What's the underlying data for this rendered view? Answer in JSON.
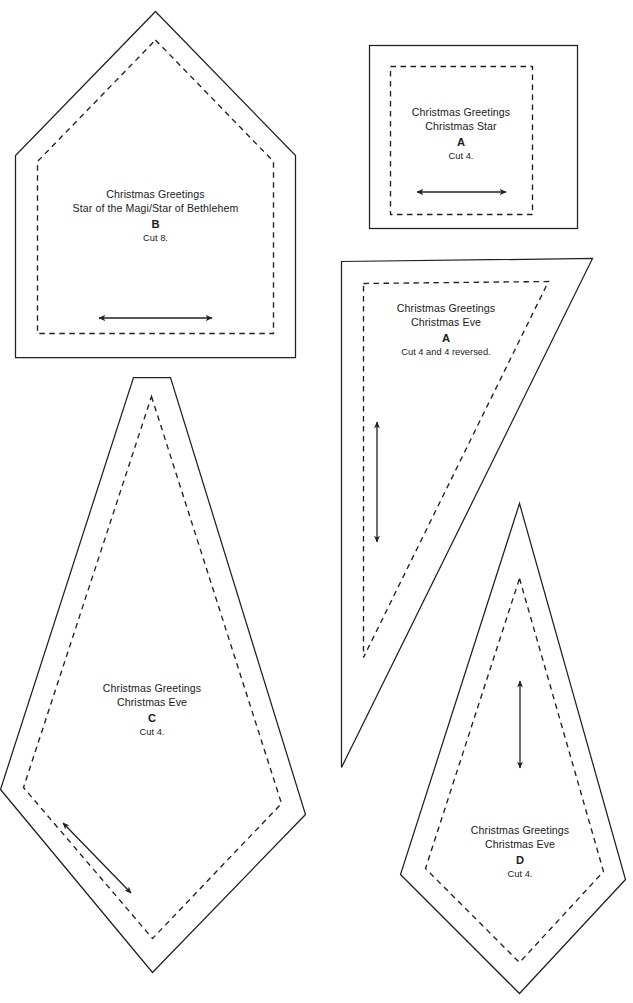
{
  "document": {
    "kind": "quilt-template-sheet",
    "page_background": "#ffffff",
    "ink_color": "#221f1f"
  },
  "footer": {
    "text": ""
  },
  "templates": [
    {
      "id": "B",
      "shape": "pentagon-house",
      "line1": "Christmas Greetings",
      "line2": "Star of the Magi/Star of Bethlehem",
      "letter": "B",
      "cut": "Cut 8.",
      "grain": {
        "direction": "horizontal",
        "arrowheads": "both"
      }
    },
    {
      "id": "A-star",
      "shape": "square",
      "line1": "Christmas Greetings",
      "line2": "Christmas Star",
      "letter": "A",
      "cut": "Cut 4.",
      "grain": {
        "direction": "horizontal",
        "arrowheads": "both"
      }
    },
    {
      "id": "A-eve",
      "shape": "right-triangle",
      "line1": "Christmas Greetings",
      "line2": "Christmas Eve",
      "letter": "A",
      "cut": "Cut 4 and 4 reversed.",
      "grain": {
        "direction": "vertical",
        "arrowheads": "both"
      }
    },
    {
      "id": "C",
      "shape": "kite-truncated-top",
      "line1": "Christmas Greetings",
      "line2": "Christmas Eve",
      "letter": "C",
      "cut": "Cut 4.",
      "grain": {
        "direction": "diagonal",
        "arrowheads": "both"
      }
    },
    {
      "id": "D",
      "shape": "kite",
      "line1": "Christmas Greetings",
      "line2": "Christmas Eve",
      "letter": "D",
      "cut": "Cut 4.",
      "grain": {
        "direction": "vertical",
        "arrowheads": "both"
      }
    }
  ]
}
